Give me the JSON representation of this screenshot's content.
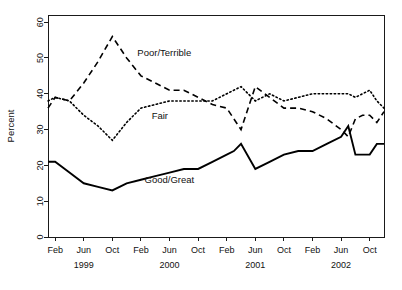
{
  "chart_data": {
    "type": "line",
    "title": "",
    "subtitle": "",
    "xlabel": "",
    "ylabel": "Percent",
    "ylim": [
      0,
      62
    ],
    "xlim": [
      0,
      47
    ],
    "grid": false,
    "legend_position": "inline-annotations",
    "y_ticks": [
      0,
      10,
      20,
      30,
      40,
      50,
      60
    ],
    "y_tick_labels": [
      "0",
      "10",
      "20",
      "30",
      "40",
      "50",
      "60"
    ],
    "x_tick_labels": [
      "Feb",
      "Jun",
      "Oct",
      "Feb",
      "Jun",
      "Oct",
      "Feb",
      "Jun",
      "Oct",
      "Feb",
      "Jun",
      "Oct"
    ],
    "x_tick_months": [
      1,
      5,
      9,
      13,
      17,
      21,
      25,
      29,
      33,
      37,
      41,
      45
    ],
    "year_labels": [
      "1999",
      "2000",
      "2001",
      "2002"
    ],
    "year_label_months": [
      5,
      17,
      29,
      41
    ],
    "annotations": [
      {
        "text": "Poor/Terrible",
        "month": 12.5,
        "value": 50.5
      },
      {
        "text": "Fair",
        "month": 14.5,
        "value": 33.0
      },
      {
        "text": "Good/Great",
        "month": 13.5,
        "value": 15.0
      }
    ],
    "series": [
      {
        "name": "Poor/Terrible",
        "style": "dashed",
        "x": [
          0,
          1,
          3,
          5,
          7,
          9,
          11,
          13,
          15,
          17,
          19,
          21,
          23,
          25,
          26,
          27,
          29,
          31,
          33,
          35,
          37,
          39,
          41,
          42,
          43,
          44,
          45,
          46,
          47
        ],
        "values": [
          36,
          39,
          38,
          43,
          49,
          56,
          50,
          45,
          43,
          41,
          41,
          39,
          37,
          36,
          33,
          30,
          42,
          39,
          36,
          36,
          35,
          33,
          30,
          28,
          33,
          34,
          34,
          32,
          35
        ]
      },
      {
        "name": "Fair",
        "style": "dotted",
        "x": [
          0,
          1,
          3,
          5,
          7,
          9,
          11,
          13,
          15,
          17,
          19,
          21,
          23,
          25,
          26,
          27,
          29,
          31,
          33,
          35,
          37,
          39,
          41,
          42,
          43,
          44,
          45,
          46,
          47
        ],
        "values": [
          38,
          39,
          38,
          34,
          31,
          27,
          32,
          36,
          37,
          38,
          38,
          38,
          38,
          40,
          41,
          42,
          38,
          40,
          38,
          39,
          40,
          40,
          40,
          40,
          39,
          40,
          41,
          38,
          36
        ]
      },
      {
        "name": "Good/Great",
        "style": "solid",
        "x": [
          0,
          1,
          3,
          5,
          7,
          9,
          11,
          13,
          15,
          17,
          19,
          21,
          23,
          25,
          26,
          27,
          29,
          31,
          33,
          35,
          37,
          39,
          41,
          42,
          43,
          44,
          45,
          46,
          47
        ],
        "values": [
          21,
          21,
          18,
          15,
          14,
          13,
          15,
          16,
          17,
          18,
          19,
          19,
          21,
          23,
          24,
          26,
          19,
          21,
          23,
          24,
          24,
          26,
          28,
          31,
          23,
          23,
          23,
          26,
          26
        ]
      }
    ]
  },
  "axis": {
    "y_title": "Percent"
  }
}
